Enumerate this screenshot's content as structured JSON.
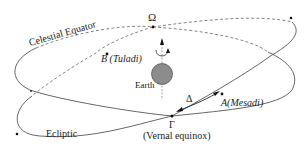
{
  "diagram": {
    "type": "celestial-sphere-schematic",
    "curves": {
      "equator": {
        "label": "Celestial Equator"
      },
      "ecliptic": {
        "label": "Ecliptic"
      }
    },
    "points": {
      "ascending_node": {
        "symbol": "Ω"
      },
      "vernal_equinox": {
        "symbol": "Γ",
        "caption": "(Vernal equinox)"
      },
      "star_a": {
        "label": "A(Mesadi)"
      },
      "star_b": {
        "label": "B (Tuladi)"
      }
    },
    "center": {
      "label": "Earth",
      "color": "#8c8c8c"
    },
    "arc": {
      "symbol": "Δ"
    },
    "colors": {
      "line": "#555555",
      "dashed": "#777777",
      "text": "#1a1a1a",
      "background": "#ffffff"
    }
  }
}
